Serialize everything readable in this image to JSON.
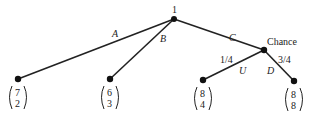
{
  "nodes": {
    "root": {
      "label": "1"
    },
    "chance": {
      "label": "Chance"
    }
  },
  "edges": {
    "A": {
      "label": "A"
    },
    "B": {
      "label": "B"
    },
    "C": {
      "label": "C"
    },
    "U": {
      "label": "U",
      "probability": "1/4"
    },
    "D": {
      "label": "D",
      "probability": "3/4"
    }
  },
  "payoffs": [
    {
      "leaf": "A",
      "top": "7",
      "bottom": "2"
    },
    {
      "leaf": "B",
      "top": "6",
      "bottom": "3"
    },
    {
      "leaf": "U",
      "top": "8",
      "bottom": "4"
    },
    {
      "leaf": "D",
      "top": "8",
      "bottom": "8"
    }
  ],
  "colors": {
    "line": "#222222",
    "node": "#111111"
  }
}
